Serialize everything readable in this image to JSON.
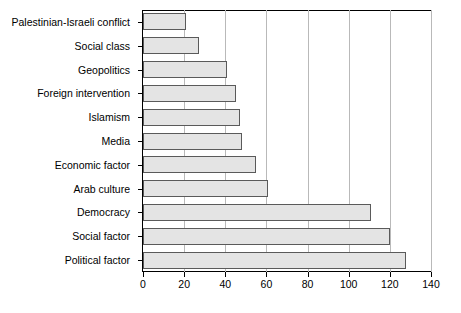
{
  "chart_data": {
    "type": "bar",
    "orientation": "horizontal",
    "title": "",
    "xlabel": "",
    "ylabel": "",
    "xlim": [
      0,
      140
    ],
    "xticks": [
      0,
      20,
      40,
      60,
      80,
      100,
      120,
      140
    ],
    "xtick_labels": [
      "0",
      "20",
      "40",
      "60",
      "80",
      "100",
      "120",
      "140"
    ],
    "grid": "vertical",
    "legend": "none",
    "categories": [
      "Palestinian-Israeli conflict",
      "Social class",
      "Geopolitics",
      "Foreign intervention",
      "Islamism",
      "Media",
      "Economic factor",
      "Arab culture",
      "Democracy",
      "Social factor",
      "Political factor"
    ],
    "values": [
      21,
      27,
      41,
      45,
      47,
      48,
      55,
      61,
      111,
      120,
      128
    ],
    "bar_fill_color": "#e4e4e4",
    "bar_border_color": "#5a5a5a",
    "gridline_color": "#b9b9b9",
    "axis_color": "#000000",
    "background_color": "#ffffff"
  }
}
